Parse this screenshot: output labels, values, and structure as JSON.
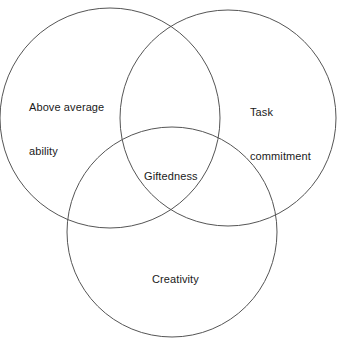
{
  "diagram": {
    "type": "venn-3-circle",
    "background_color": "#ffffff",
    "stroke_color": "#555555",
    "text_color": "#1a1a1a",
    "circles": [
      {
        "name": "above-average-ability",
        "cx": 110,
        "cy": 118,
        "r": 110,
        "label_lines": [
          "Above average",
          "ability"
        ]
      },
      {
        "name": "task-commitment",
        "cx": 228,
        "cy": 118,
        "r": 108,
        "label_lines": [
          "Task",
          "commitment"
        ]
      },
      {
        "name": "creativity",
        "cx": 172,
        "cy": 232,
        "r": 105,
        "label_lines": [
          "Creativity"
        ]
      }
    ],
    "intersection": {
      "name": "giftedness",
      "label": "Giftedness"
    },
    "labels": {
      "above_average_line1": "Above average",
      "above_average_line2": "ability",
      "task_line1": "Task",
      "task_line2": "commitment",
      "creativity": "Creativity",
      "giftedness": "Giftedness"
    }
  }
}
